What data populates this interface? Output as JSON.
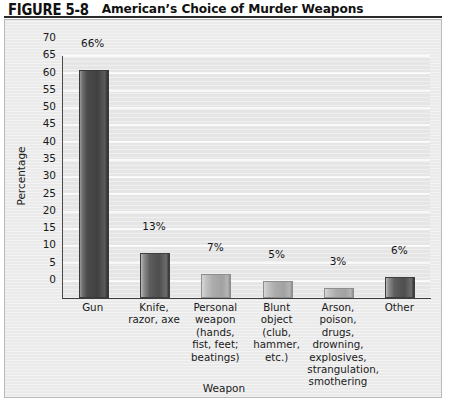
{
  "figure": {
    "number_label": "FIGURE 5-8",
    "title": "American’s Choice of Murder Weapons"
  },
  "chart_data": {
    "type": "bar",
    "title": "American’s Choice of Murder Weapons",
    "xlabel": "Weapon",
    "ylabel": "Percentage",
    "ylim": [
      0,
      70
    ],
    "ytick_labels": [
      "0",
      "5",
      "10",
      "15",
      "20",
      "25",
      "30",
      "35",
      "40",
      "45",
      "50",
      "55",
      "60",
      "65",
      "70"
    ],
    "ytick_values": [
      0,
      5,
      10,
      15,
      20,
      25,
      30,
      35,
      40,
      45,
      50,
      55,
      60,
      65,
      70
    ],
    "grid": true,
    "legend": "none",
    "categories": [
      "Gun",
      "Knife,\nrazor, axe",
      "Personal\nweapon\n(hands,\nfist, feet;\nbeatings)",
      "Blunt object\n(club,\nhammer,\netc.)",
      "Arson, poison,\ndrugs,\ndrowning,\nexplosives,\nstrangulation,\nsmothering",
      "Other"
    ],
    "values": [
      66,
      13,
      7,
      5,
      3,
      6
    ],
    "data_labels": [
      "66%",
      "13%",
      "7%",
      "5%",
      "3%",
      "6%"
    ],
    "bar_shades": [
      "dark",
      "mid",
      "light",
      "light",
      "light",
      "mid"
    ]
  },
  "colors": {
    "page_background": "#ffffff",
    "panel_background": "#ededed",
    "plot_background": "#e8e8e8",
    "gridline": "#fbfbfb",
    "axis": "#3d3d3d",
    "text": "#1a1a1a",
    "bar_dark": "#414141",
    "bar_mid": "#4e4e4e",
    "bar_light": "#a8a8a8"
  }
}
